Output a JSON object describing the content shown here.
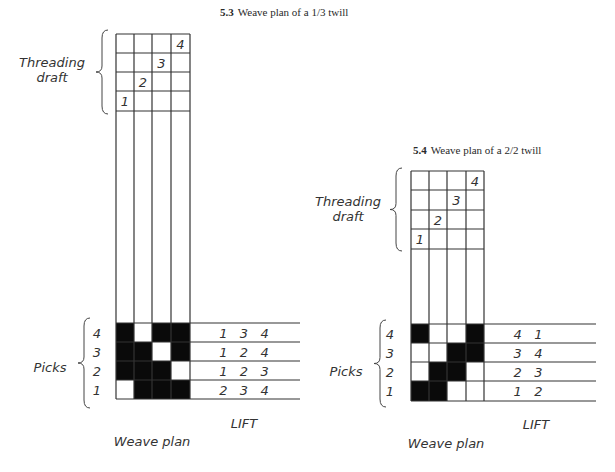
{
  "figures": [
    {
      "id": "5.3",
      "caption_number": "5.3",
      "caption_text": "Weave plan of a 1/3 twill",
      "caption_pos": [
        220,
        8
      ],
      "grid": {
        "x": [
          116,
          134,
          152,
          171,
          190
        ],
        "threading_rows_y": [
          34,
          53,
          72,
          91,
          111
        ],
        "weave_rows_y": [
          323,
          342,
          361,
          380,
          399
        ]
      },
      "threading_numbers": [
        {
          "col": 0,
          "row": 3,
          "label": "1"
        },
        {
          "col": 1,
          "row": 2,
          "label": "2"
        },
        {
          "col": 2,
          "row": 1,
          "label": "3"
        },
        {
          "col": 3,
          "row": 0,
          "label": "4"
        }
      ],
      "threading_label": [
        "Threading",
        "draft"
      ],
      "threading_label_pos": [
        52,
        67
      ],
      "threading_brace": {
        "x": 102,
        "y1": 30,
        "y2": 114
      },
      "weave_pattern": [
        [
          1,
          0,
          1,
          1
        ],
        [
          1,
          1,
          0,
          1
        ],
        [
          1,
          1,
          1,
          0
        ],
        [
          0,
          1,
          1,
          1
        ]
      ],
      "picks": [
        "4",
        "3",
        "2",
        "1"
      ],
      "picks_label": "Picks",
      "picks_label_pos": [
        50,
        372
      ],
      "picks_numbers_x": 97,
      "picks_brace": {
        "x": 84,
        "y1": 318,
        "y2": 408
      },
      "lift_line_end": 300,
      "lift": [
        "1   3   4",
        "1   2   4",
        "1   2   3",
        "2   3   4"
      ],
      "lift_text_x": 244,
      "lift_label": "LIFT",
      "lift_label_pos": [
        244,
        428
      ],
      "weave_plan_label": "Weave plan",
      "weave_plan_label_pos": [
        152,
        446
      ]
    },
    {
      "id": "5.4",
      "caption_number": "5.4",
      "caption_text": "Weave plan of a 2/2 twill",
      "caption_pos": [
        413,
        147
      ],
      "grid": {
        "x": [
          411,
          429,
          447,
          466,
          484
        ],
        "threading_rows_y": [
          171,
          190,
          210,
          229,
          249
        ],
        "weave_rows_y": [
          324,
          343,
          362,
          381,
          401
        ]
      },
      "threading_numbers": [
        {
          "col": 0,
          "row": 3,
          "label": "1"
        },
        {
          "col": 1,
          "row": 2,
          "label": "2"
        },
        {
          "col": 2,
          "row": 1,
          "label": "3"
        },
        {
          "col": 3,
          "row": 0,
          "label": "4"
        }
      ],
      "threading_label": [
        "Threading",
        "draft"
      ],
      "threading_label_pos": [
        348,
        206
      ],
      "threading_brace": {
        "x": 396,
        "y1": 168,
        "y2": 251
      },
      "weave_pattern": [
        [
          1,
          0,
          0,
          1
        ],
        [
          0,
          0,
          1,
          1
        ],
        [
          0,
          1,
          1,
          0
        ],
        [
          1,
          1,
          0,
          0
        ]
      ],
      "picks": [
        "4",
        "3",
        "2",
        "1"
      ],
      "picks_label": "Picks",
      "picks_label_pos": [
        346,
        376
      ],
      "picks_numbers_x": 390,
      "picks_brace": {
        "x": 380,
        "y1": 320,
        "y2": 407
      },
      "lift_line_end": 596,
      "lift": [
        "4   1",
        "3   4",
        "2   3",
        "1   2"
      ],
      "lift_text_x": 528,
      "lift_label": "LIFT",
      "lift_label_pos": [
        536,
        429
      ],
      "weave_plan_label": "Weave plan",
      "weave_plan_label_pos": [
        446,
        448
      ]
    }
  ]
}
